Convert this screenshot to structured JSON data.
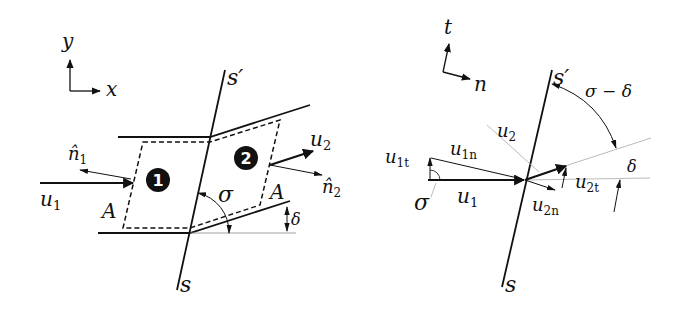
{
  "left_panel": {
    "axes": {
      "vertical": "y",
      "horizontal": "x"
    },
    "shock_ends": {
      "top": "s′",
      "bottom": "s"
    },
    "regions": {
      "upstream": "1",
      "downstream": "2"
    },
    "vectors": {
      "u1": "u",
      "u1_sub": "1",
      "u2": "u",
      "u2_sub": "2",
      "n1_hat": "n̂",
      "n1_sub": "1",
      "n2_hat": "n̂",
      "n2_sub": "2"
    },
    "area_labels": [
      "A",
      "A"
    ],
    "angles": {
      "shock_angle": "σ",
      "deflection": "δ"
    }
  },
  "right_panel": {
    "axes": {
      "vertical": "t",
      "horizontal": "n"
    },
    "shock_ends": {
      "top": "s′",
      "bottom": "s"
    },
    "vectors": {
      "u1": {
        "base": "u",
        "sub": "1"
      },
      "u1t": {
        "base": "u",
        "sub": "1t"
      },
      "u1n": {
        "base": "u",
        "sub": "1n"
      },
      "u2": {
        "base": "u",
        "sub": "2"
      },
      "u2t": {
        "base": "u",
        "sub": "2t"
      },
      "u2n": {
        "base": "u",
        "sub": "2n"
      }
    },
    "angles": {
      "shock_angle": "σ",
      "deflection": "δ",
      "difference": "σ − δ"
    }
  }
}
